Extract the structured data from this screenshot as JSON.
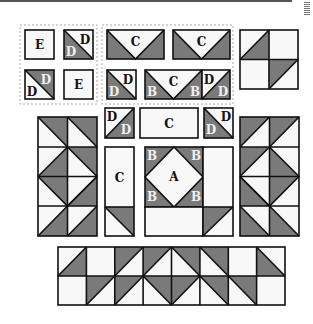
{
  "colors": {
    "dark": "#7a7a7a",
    "light": "#f8f8f8",
    "stroke": "#111111",
    "dashed": "#aaaaaa"
  },
  "labels": {
    "A": "A",
    "B": "B",
    "C": "C",
    "D": "D",
    "E": "E"
  },
  "groups": {
    "pieces_group_1": [
      "E",
      "D/D",
      "D/D",
      "E"
    ],
    "pieces_group_2": [
      "C",
      "C",
      "D/D",
      "B C B",
      "D/D"
    ],
    "center_block": [
      "D/D",
      "C",
      "D/D",
      "C",
      "A",
      "B",
      "B",
      "B",
      "B"
    ]
  }
}
